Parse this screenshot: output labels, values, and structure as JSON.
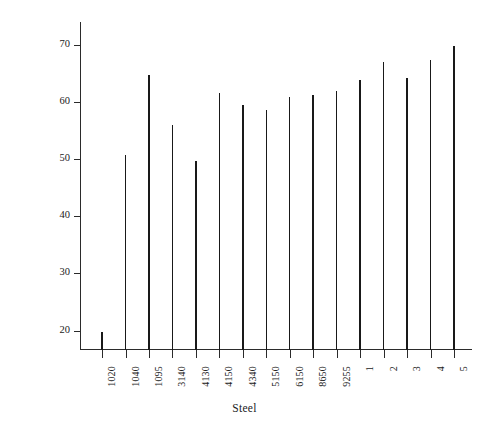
{
  "chart_data": {
    "type": "bar",
    "title": "",
    "subtitle": "",
    "xlabel": "Steel",
    "ylabel": "Rockwell C",
    "grid": false,
    "legend": "none",
    "categories": [
      "1020",
      "1040",
      "1095",
      "3140",
      "4130",
      "4150",
      "4340",
      "5150",
      "6150",
      "8650",
      "9255",
      "1",
      "2",
      "3",
      "4",
      "5"
    ],
    "values": [
      19.7,
      50.8,
      64.7,
      56.0,
      49.6,
      61.5,
      59.4,
      58.6,
      60.8,
      61.3,
      62.0,
      63.8,
      67.0,
      64.2,
      67.3,
      69.8
    ],
    "ylim": [
      16.6,
      74.0
    ],
    "ytick_values": [
      20,
      30,
      40,
      50,
      60,
      70
    ],
    "ytick_labels": [
      "20",
      "30",
      "40",
      "50",
      "60",
      "70"
    ],
    "xtick_labels": [
      "1020",
      "1040",
      "1095",
      "3140",
      "4130",
      "4150",
      "4340",
      "5150",
      "6150",
      "8650",
      "9255",
      "1",
      "2",
      "3",
      "4",
      "5"
    ],
    "series": [
      {
        "name": "Rockwell C",
        "values": [
          19.7,
          50.8,
          64.7,
          56.0,
          49.6,
          61.5,
          59.4,
          58.6,
          60.8,
          61.3,
          62.0,
          63.8,
          67.0,
          64.2,
          67.3,
          69.8
        ]
      }
    ],
    "colors": {
      "bar": "#191919",
      "axis": "#2b2b2b",
      "text": "#222222",
      "background": "#ffffff"
    }
  }
}
